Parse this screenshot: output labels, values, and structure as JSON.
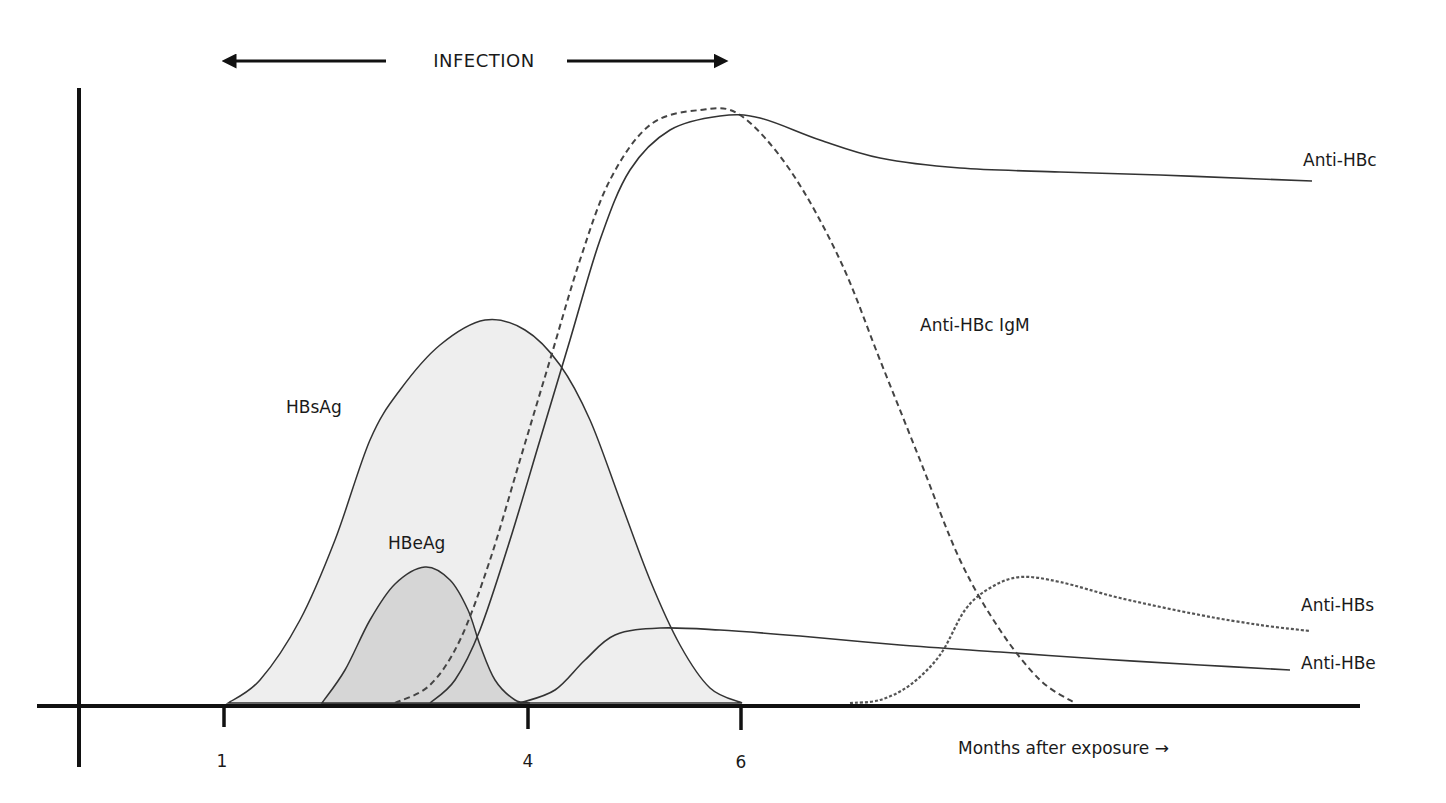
{
  "chart_data": {
    "type": "line",
    "title": "INFECTION",
    "xlabel": "Months after exposure →",
    "ylabel": "",
    "x_ticks": [
      {
        "label": "1",
        "px": 224
      },
      {
        "label": "4",
        "px": 528
      },
      {
        "label": "6",
        "px": 741
      }
    ],
    "infection_span_px": [
      228,
      722
    ],
    "legend_position": "inline labels at curve ends",
    "grid": false,
    "series": [
      {
        "name": "HBsAg",
        "style": "solid-filled",
        "fill": "#eeeeee",
        "label_px": [
          286,
          413
        ],
        "points_px": [
          [
            228,
            703
          ],
          [
            260,
            680
          ],
          [
            300,
            620
          ],
          [
            335,
            540
          ],
          [
            370,
            440
          ],
          [
            400,
            390
          ],
          [
            440,
            345
          ],
          [
            485,
            320
          ],
          [
            525,
            330
          ],
          [
            560,
            365
          ],
          [
            590,
            420
          ],
          [
            620,
            500
          ],
          [
            650,
            580
          ],
          [
            680,
            645
          ],
          [
            710,
            688
          ],
          [
            742,
            703
          ]
        ]
      },
      {
        "name": "HBeAg",
        "style": "solid-filled",
        "fill": "#d6d6d6",
        "label_px": [
          388,
          582
        ],
        "points_px": [
          [
            322,
            703
          ],
          [
            345,
            670
          ],
          [
            370,
            620
          ],
          [
            395,
            584
          ],
          [
            425,
            567
          ],
          [
            450,
            580
          ],
          [
            468,
            610
          ],
          [
            480,
            645
          ],
          [
            495,
            680
          ],
          [
            515,
            700
          ],
          [
            530,
            703
          ]
        ]
      },
      {
        "name": "Anti-HBc IgM",
        "style": "dashed",
        "label_px": [
          948,
          331
        ],
        "points_px": [
          [
            395,
            703
          ],
          [
            430,
            685
          ],
          [
            460,
            640
          ],
          [
            490,
            560
          ],
          [
            520,
            460
          ],
          [
            550,
            360
          ],
          [
            580,
            260
          ],
          [
            610,
            180
          ],
          [
            650,
            125
          ],
          [
            700,
            110
          ],
          [
            740,
            115
          ],
          [
            790,
            170
          ],
          [
            840,
            260
          ],
          [
            880,
            360
          ],
          [
            920,
            460
          ],
          [
            960,
            560
          ],
          [
            1000,
            630
          ],
          [
            1040,
            680
          ],
          [
            1075,
            703
          ]
        ]
      },
      {
        "name": "Anti-HBc",
        "style": "solid",
        "label_px": [
          1302,
          164
        ],
        "points_px": [
          [
            430,
            703
          ],
          [
            455,
            680
          ],
          [
            480,
            630
          ],
          [
            510,
            540
          ],
          [
            540,
            440
          ],
          [
            570,
            340
          ],
          [
            600,
            240
          ],
          [
            630,
            170
          ],
          [
            670,
            130
          ],
          [
            720,
            116
          ],
          [
            760,
            118
          ],
          [
            820,
            140
          ],
          [
            880,
            158
          ],
          [
            960,
            168
          ],
          [
            1060,
            172
          ],
          [
            1160,
            175
          ],
          [
            1260,
            179
          ],
          [
            1312,
            181
          ]
        ]
      },
      {
        "name": "Anti-HBe",
        "style": "solid",
        "label_px": [
          1300,
          669
        ],
        "points_px": [
          [
            520,
            703
          ],
          [
            555,
            690
          ],
          [
            585,
            660
          ],
          [
            615,
            635
          ],
          [
            660,
            628
          ],
          [
            720,
            630
          ],
          [
            800,
            636
          ],
          [
            900,
            645
          ],
          [
            1000,
            652
          ],
          [
            1100,
            659
          ],
          [
            1200,
            665
          ],
          [
            1290,
            670
          ]
        ]
      },
      {
        "name": "Anti-HBs",
        "style": "dotted",
        "label_px": [
          1300,
          611
        ],
        "points_px": [
          [
            850,
            703
          ],
          [
            880,
            700
          ],
          [
            910,
            685
          ],
          [
            940,
            655
          ],
          [
            965,
            610
          ],
          [
            990,
            588
          ],
          [
            1020,
            577
          ],
          [
            1060,
            582
          ],
          [
            1120,
            598
          ],
          [
            1200,
            615
          ],
          [
            1260,
            625
          ],
          [
            1310,
            631
          ]
        ]
      }
    ],
    "axes": {
      "y_axis_px": {
        "x": 79,
        "y_top": 88,
        "y_bottom": 767
      },
      "x_axis_px": {
        "y": 706,
        "x_left": 37,
        "x_right": 1360
      }
    }
  },
  "labels": {
    "title": "INFECTION",
    "xlabel": "Months after exposure →",
    "hbsag": "HBsAg",
    "hbeag": "HBeAg",
    "anti_hbc_igm": "Anti-HBc IgM",
    "anti_hbc": "Anti-HBc",
    "anti_hbe": "Anti-HBe",
    "anti_hbs": "Anti-HBs",
    "tick_1": "1",
    "tick_4": "4",
    "tick_6": "6"
  }
}
